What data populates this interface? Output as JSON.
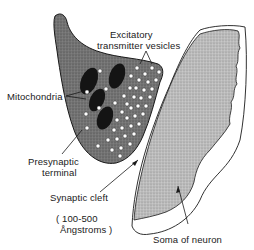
{
  "diagram": {
    "type": "anatomical-illustration",
    "labels": {
      "vesicles_line1": "Excitatory",
      "vesicles_line2": "transmitter vesicles",
      "mitochondria": "Mitochondria",
      "terminal_line1": "Presynaptic",
      "terminal_line2": "terminal",
      "cleft": "Synaptic cleft",
      "cleft_size_line1": "( 100-500",
      "cleft_size_line2": "Ångstroms )",
      "soma": "Soma of neuron"
    },
    "colors": {
      "terminal_fill": "#6e6e6e",
      "mitochondria_fill": "#141414",
      "vesicle_fill": "#ffffff",
      "soma_fill": "#b8b8b8",
      "outline": "#1a1a1a",
      "background": "#ffffff"
    }
  }
}
